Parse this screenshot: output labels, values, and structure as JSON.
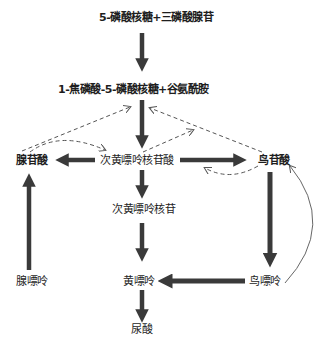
{
  "diagram": {
    "title": "",
    "nodes": {
      "prpp_sub": {
        "label": "5-磷酸核糖+三磷酸腺苷"
      },
      "prpp": {
        "label": "1-焦磷酸-5-磷酸核糖+谷氨酰胺"
      },
      "amp": {
        "label": "腺苷酸"
      },
      "imp": {
        "label": "次黄嘌呤核苷酸"
      },
      "gmp": {
        "label": "鸟苷酸"
      },
      "inosine": {
        "label": "次黄嘌呤核苷"
      },
      "adenine": {
        "label": "腺嘌呤"
      },
      "xanthine": {
        "label": "黄嘌呤"
      },
      "guanine": {
        "label": "鸟嘌呤"
      },
      "uric_acid": {
        "label": "尿酸"
      }
    },
    "edges": [
      {
        "from": "prpp_sub",
        "to": "prpp",
        "style": "solid-thick"
      },
      {
        "from": "prpp",
        "to": "imp",
        "style": "solid-thick"
      },
      {
        "from": "imp",
        "to": "amp",
        "style": "solid-thick"
      },
      {
        "from": "imp",
        "to": "gmp",
        "style": "solid-thick"
      },
      {
        "from": "imp",
        "to": "inosine",
        "style": "solid-thick"
      },
      {
        "from": "inosine",
        "to": "xanthine",
        "style": "solid-thick"
      },
      {
        "from": "adenine",
        "to": "amp",
        "style": "solid-thick"
      },
      {
        "from": "gmp",
        "to": "guanine",
        "style": "solid-thick"
      },
      {
        "from": "guanine",
        "to": "xanthine",
        "style": "solid-thick"
      },
      {
        "from": "xanthine",
        "to": "uric_acid",
        "style": "solid-thick"
      },
      {
        "from": "amp",
        "to": "prpp",
        "style": "dashed",
        "meaning": "feedback inhibition"
      },
      {
        "from": "amp",
        "to": "imp",
        "style": "dashed-curved"
      },
      {
        "from": "imp",
        "to": "prpp",
        "style": "dashed"
      },
      {
        "from": "gmp",
        "to": "prpp",
        "style": "dashed"
      },
      {
        "from": "gmp",
        "to": "imp",
        "style": "dashed-curved"
      },
      {
        "from": "guanine",
        "to": "gmp",
        "style": "thin-curved"
      }
    ],
    "colors": {
      "arrow": "#3a3a3a",
      "dashed": "#555555",
      "text": "#1e1e1e",
      "background": "#ffffff"
    }
  }
}
